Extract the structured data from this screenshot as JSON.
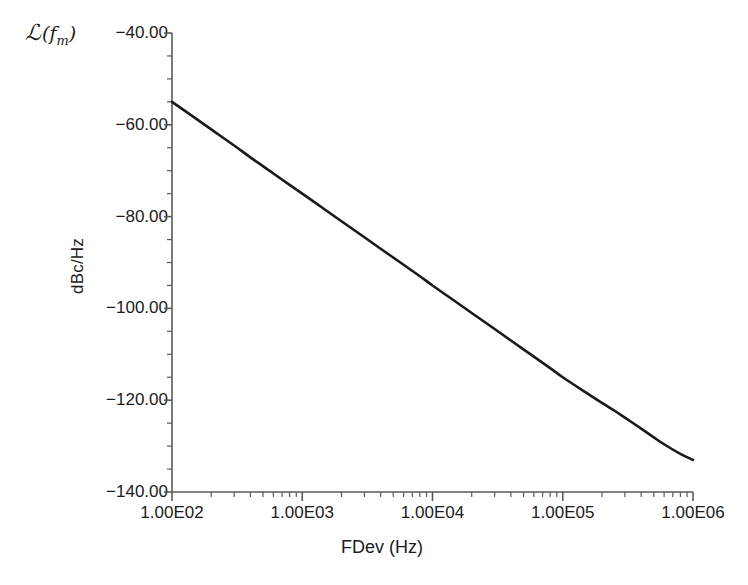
{
  "chart_data": {
    "type": "line",
    "title": "",
    "xlabel": "FDev (Hz)",
    "ylabel": "dBc/Hz",
    "series_symbol": "L(fm)",
    "xscale": "log",
    "yscale": "linear",
    "xlim": [
      100,
      1000000
    ],
    "ylim": [
      -140,
      -40
    ],
    "grid": false,
    "legend": "none",
    "xtick_labels": [
      "1.00E02",
      "1.00E03",
      "1.00E04",
      "1.00E05",
      "1.00E06"
    ],
    "xtick_values": [
      100,
      1000,
      10000,
      100000,
      1000000
    ],
    "ytick_labels": [
      "-40.00",
      "-60.00",
      "-80.00",
      "-100.00",
      "-120.00",
      "-140.00"
    ],
    "ytick_values": [
      -40,
      -60,
      -80,
      -100,
      -120,
      -140
    ],
    "line_color": "#1a1a1a",
    "line_width_px": 2.6,
    "series": [
      {
        "name": "phase-noise",
        "x": [
          100,
          150,
          200,
          300,
          400,
          600,
          800,
          1000,
          1500,
          2000,
          3000,
          4000,
          6000,
          8000,
          10000,
          15000,
          20000,
          30000,
          40000,
          60000,
          80000,
          100000,
          150000,
          200000,
          250000,
          300000,
          400000,
          500000,
          600000,
          800000,
          1000000
        ],
        "y": [
          -55.0,
          -58.5,
          -61.0,
          -64.5,
          -67.1,
          -70.6,
          -73.1,
          -75.0,
          -78.5,
          -81.0,
          -84.5,
          -87.0,
          -90.5,
          -93.0,
          -95.0,
          -98.5,
          -101.0,
          -104.5,
          -107.0,
          -110.5,
          -113.0,
          -115.0,
          -118.3,
          -120.6,
          -122.3,
          -123.8,
          -126.2,
          -128.1,
          -129.6,
          -131.7,
          -133.0
        ]
      }
    ]
  },
  "axes": {
    "y_axis_title": "dBc/Hz",
    "x_axis_title": "FDev (Hz)",
    "symbol_prefix": "L",
    "symbol_arg": "f",
    "symbol_sub": "m"
  },
  "caption": {
    "text": ""
  }
}
